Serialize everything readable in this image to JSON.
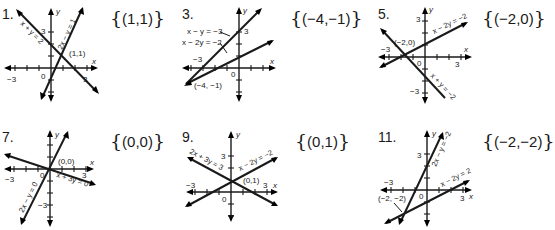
{
  "problems": [
    {
      "number": "1.",
      "answer": "(1,1)",
      "graph": {
        "origin_label": "0",
        "x_axis_label": "x",
        "y_axis_label": "y",
        "x_ticks_labeled": [
          "−3",
          "3"
        ],
        "y_ticks_labeled": [
          "3"
        ],
        "lines": [
          {
            "equation": "x + y = 2"
          },
          {
            "equation": "2x − y = 1"
          }
        ],
        "intersection_label": "(1,1)"
      }
    },
    {
      "number": "3.",
      "answer": "(−4,−1)",
      "graph": {
        "origin_label": "0",
        "x_axis_label": "x",
        "y_axis_label": "y",
        "x_ticks_labeled": [
          "−3"
        ],
        "y_ticks_labeled": [
          "3"
        ],
        "lines": [
          {
            "equation": "x − y = −3"
          },
          {
            "equation": "x − 2y = −2"
          }
        ],
        "intersection_label": "(−4, −1)"
      }
    },
    {
      "number": "5.",
      "answer": "(−2,0)",
      "graph": {
        "origin_label": "0",
        "x_axis_label": "x",
        "y_axis_label": "y",
        "x_ticks_labeled": [
          "−3",
          "3"
        ],
        "y_ticks_labeled": [
          "3",
          "−3"
        ],
        "lines": [
          {
            "equation": "x − 2y = −2"
          },
          {
            "equation": "x + y = −2"
          }
        ],
        "intersection_label": "(−2,0)"
      }
    },
    {
      "number": "7.",
      "answer": "(0,0)",
      "graph": {
        "origin_label": "0",
        "x_axis_label": "x",
        "y_axis_label": "y",
        "x_ticks_labeled": [
          "−3",
          "3"
        ],
        "y_ticks_labeled": [
          "−3"
        ],
        "lines": [
          {
            "equation": "x + 3y = 0"
          },
          {
            "equation": "2x − y = 0"
          }
        ],
        "intersection_label": "(0,0)"
      }
    },
    {
      "number": "9.",
      "answer": "(0,1)",
      "graph": {
        "origin_label": "0",
        "x_axis_label": "x",
        "y_axis_label": "y",
        "x_ticks_labeled": [
          "−3",
          "3"
        ],
        "y_ticks_labeled": [
          "3"
        ],
        "lines": [
          {
            "equation": "2x + 3y = 3"
          },
          {
            "equation": "x − 2y = −2"
          }
        ],
        "intersection_label": "(0,1)"
      }
    },
    {
      "number": "11.",
      "answer": "(−2,−2)",
      "graph": {
        "origin_label": "0",
        "x_axis_label": "x",
        "y_axis_label": "y",
        "x_ticks_labeled": [
          "−3",
          "3"
        ],
        "y_ticks_labeled": [
          "3"
        ],
        "lines": [
          {
            "equation": "2x − y = −2"
          },
          {
            "equation": "x − 2y = 2"
          }
        ],
        "intersection_label": "(−2, −2)"
      }
    }
  ],
  "braces": {
    "open": "{",
    "close": "}"
  }
}
